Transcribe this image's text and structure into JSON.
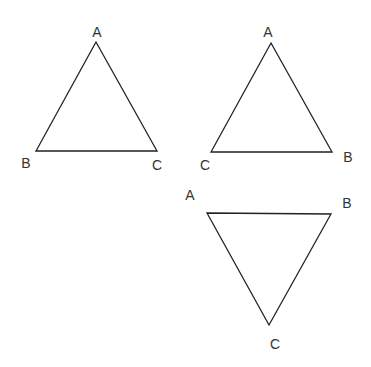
{
  "diagram": {
    "type": "triangles",
    "stroke_color": "#222222",
    "label_color": "#333333",
    "triangles": [
      {
        "id": "triangle-1",
        "orientation": "apex-up",
        "vertices": [
          {
            "label": "A",
            "x": 96,
            "y": 42,
            "lx": 97,
            "ly": 37
          },
          {
            "label": "B",
            "x": 36,
            "y": 151,
            "lx": 26,
            "ly": 168
          },
          {
            "label": "C",
            "x": 157,
            "y": 151,
            "lx": 157,
            "ly": 170
          }
        ]
      },
      {
        "id": "triangle-2",
        "orientation": "apex-up",
        "vertices": [
          {
            "label": "A",
            "x": 271,
            "y": 43,
            "lx": 268,
            "ly": 37
          },
          {
            "label": "B",
            "x": 332,
            "y": 152,
            "lx": 348,
            "ly": 162
          },
          {
            "label": "C",
            "x": 211,
            "y": 152,
            "lx": 205,
            "ly": 170
          }
        ]
      },
      {
        "id": "triangle-3",
        "orientation": "apex-down",
        "vertices": [
          {
            "label": "A",
            "x": 207,
            "y": 213,
            "lx": 190,
            "ly": 200
          },
          {
            "label": "B",
            "x": 331,
            "y": 214,
            "lx": 347,
            "ly": 208
          },
          {
            "label": "C",
            "x": 269,
            "y": 325,
            "lx": 275,
            "ly": 349
          }
        ]
      }
    ]
  }
}
